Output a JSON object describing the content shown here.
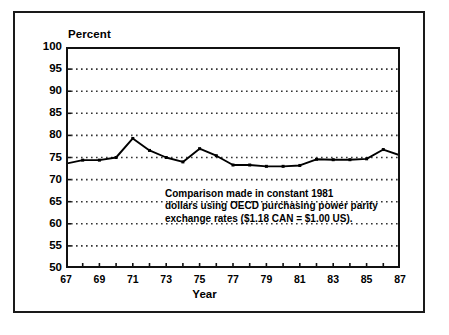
{
  "figure": {
    "y_axis_title": "Percent",
    "x_axis_title": "Year",
    "annotation_lines": [
      "Comparison made in constant 1981",
      "dollars using OECD purchasing power parity",
      "exchange rates ($1.18 CAN = $1.00 US)."
    ],
    "line_color": "#000000",
    "grid_color": "#333333",
    "frame_color": "#111111",
    "background_color": "#ffffff"
  },
  "chart_data": {
    "type": "line",
    "title": "",
    "xlabel": "Year",
    "ylabel": "Percent",
    "ylim": [
      50,
      100
    ],
    "xlim": [
      67,
      87
    ],
    "ytick_labels": [
      "100",
      "95",
      "90",
      "85",
      "80",
      "75",
      "70",
      "65",
      "60",
      "55",
      "50"
    ],
    "yticks": [
      100,
      95,
      90,
      85,
      80,
      75,
      70,
      65,
      60,
      55,
      50
    ],
    "xtick_labels": [
      "67",
      "69",
      "71",
      "73",
      "75",
      "77",
      "79",
      "81",
      "83",
      "85",
      "87"
    ],
    "xticks": [
      67,
      69,
      71,
      73,
      75,
      77,
      79,
      81,
      83,
      85,
      87
    ],
    "xticks_minor": [
      68,
      70,
      72,
      74,
      76,
      78,
      80,
      82,
      84,
      86
    ],
    "grid": true,
    "grid_style": "dotted",
    "grid_axis": "y",
    "legend": null,
    "annotations": [
      "Comparison made in constant 1981 dollars using OECD purchasing power parity exchange rates ($1.18 CAN = $1.00 US)."
    ],
    "x": [
      67,
      68,
      69,
      70,
      71,
      72,
      73,
      74,
      75,
      76,
      77,
      78,
      79,
      80,
      81,
      82,
      83,
      84,
      85,
      86,
      87
    ],
    "values": [
      73.6,
      74.4,
      74.4,
      75.0,
      79.3,
      76.6,
      75.0,
      74.0,
      77.0,
      75.4,
      73.3,
      73.3,
      73.0,
      73.0,
      73.2,
      74.6,
      74.5,
      74.5,
      74.7,
      76.8,
      75.5
    ],
    "marker": "square",
    "marker_size": 3
  }
}
